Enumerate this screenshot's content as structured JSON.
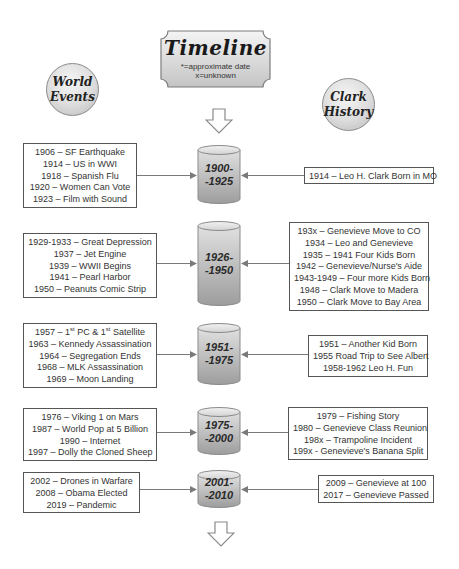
{
  "header": {
    "title": "Timeline",
    "note_line1": "*=approximate date",
    "note_line2": "x=unknown"
  },
  "columns": {
    "left": {
      "line1": "World",
      "line2": "Events"
    },
    "right": {
      "line1": "Clark",
      "line2": "History"
    }
  },
  "eras": [
    {
      "label_line1": "1900-",
      "label_line2": "-1925",
      "world_events": [
        "1906 – SF Earthquake",
        "1914 – US in WWI",
        "1918 – Spanish Flu",
        "1920 – Women Can Vote",
        "1923 – Film with Sound"
      ],
      "clark_history": [
        "1914 – Leo H. Clark Born in MO"
      ]
    },
    {
      "label_line1": "1926-",
      "label_line2": "-1950",
      "world_events": [
        "1929-1933 – Great Depression",
        "1937 – Jet Engine",
        "1939 – WWII Begins",
        "1941 – Pearl Harbor",
        "1950 – Peanuts Comic Strip"
      ],
      "clark_history": [
        "193x – Genevieve Move to CO",
        "1934 – Leo and Genevieve",
        "1935 – 1941 Four Kids Born",
        "1942 – Genevieve/Nurse's Aide",
        "1943-1949 – Four more Kids Born",
        "1948 – Clark Move to Madera",
        "1950 – Clark Move to Bay Area"
      ]
    },
    {
      "label_line1": "1951-",
      "label_line2": "-1975",
      "world_events": [
        "1957 – 1st PC & 1st Satellite",
        "1963 – Kennedy Assassination",
        "1964 – Segregation Ends",
        "1968 – MLK Assassination",
        "1969 – Moon Landing"
      ],
      "clark_history": [
        "1951 – Another Kid Born",
        "1955 Road Trip to See Albert",
        "1958-1962 Leo H. Fun"
      ]
    },
    {
      "label_line1": "1975-",
      "label_line2": "-2000",
      "world_events": [
        "1976 – Viking 1 on Mars",
        "1987 – World Pop at 5 Billion",
        "1990 – Internet",
        "1997 – Dolly the Cloned Sheep"
      ],
      "clark_history": [
        "1979 – Fishing Story",
        "1980 – Genevieve Class Reunion",
        "198x – Trampoline Incident",
        "199x - Genevieve's Banana Split"
      ]
    },
    {
      "label_line1": "2001-",
      "label_line2": "-2010",
      "world_events": [
        "2002 – Drones in Warfare",
        "2008 – Obama Elected",
        "2019 – Pandemic"
      ],
      "clark_history": [
        "2009 – Genevieve at 100",
        "2017 – Genevieve Passed"
      ]
    }
  ],
  "first_pc_parts": {
    "year": "1957 – 1",
    "sup1": "st",
    "mid": " PC & 1",
    "sup2": "st",
    "tail": " Satellite"
  }
}
